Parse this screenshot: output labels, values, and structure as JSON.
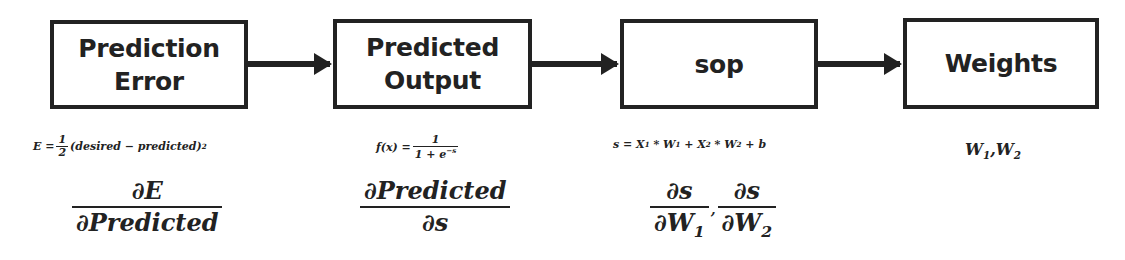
{
  "diagram": {
    "type": "flow",
    "direction": "left-to-right",
    "nodes": [
      {
        "id": "prediction_error",
        "label": "Prediction\nError"
      },
      {
        "id": "predicted_output",
        "label": "Predicted\nOutput"
      },
      {
        "id": "sop",
        "label": "sop"
      },
      {
        "id": "weights",
        "label": "Weights"
      }
    ],
    "edges": [
      {
        "from": "prediction_error",
        "to": "predicted_output"
      },
      {
        "from": "predicted_output",
        "to": "sop"
      },
      {
        "from": "sop",
        "to": "weights"
      }
    ]
  },
  "equations": {
    "error": {
      "lhs": "E =",
      "half_num": "1",
      "half_den": "2",
      "body": "(desired − predicted)",
      "exp": "2",
      "derivative_num": "∂E",
      "derivative_den": "∂Predicted"
    },
    "output": {
      "lhs": "f(x) =",
      "num": "1",
      "den_base": "1 + e",
      "den_exp": "−s",
      "derivative_num": "∂Predicted",
      "derivative_den": "∂s"
    },
    "sop": {
      "s": "s = ",
      "x1": "X",
      "x1_sub": "1",
      "times1": " * ",
      "w1": "W",
      "w1_sub": "1",
      "plus1": " + ",
      "x2": "X",
      "x2_sub": "2",
      "times2": " * ",
      "w2": "W",
      "w2_sub": "2",
      "plus2": " + b",
      "d1_num": "∂s",
      "d1_den": "∂W",
      "d1_den_sub": "1",
      "comma": ",",
      "d2_num": "∂s",
      "d2_den": "∂W",
      "d2_den_sub": "2"
    },
    "weights": {
      "w1": "W",
      "w1_sub": "1",
      "comma": ",",
      "w2": "W",
      "w2_sub": "2"
    }
  }
}
